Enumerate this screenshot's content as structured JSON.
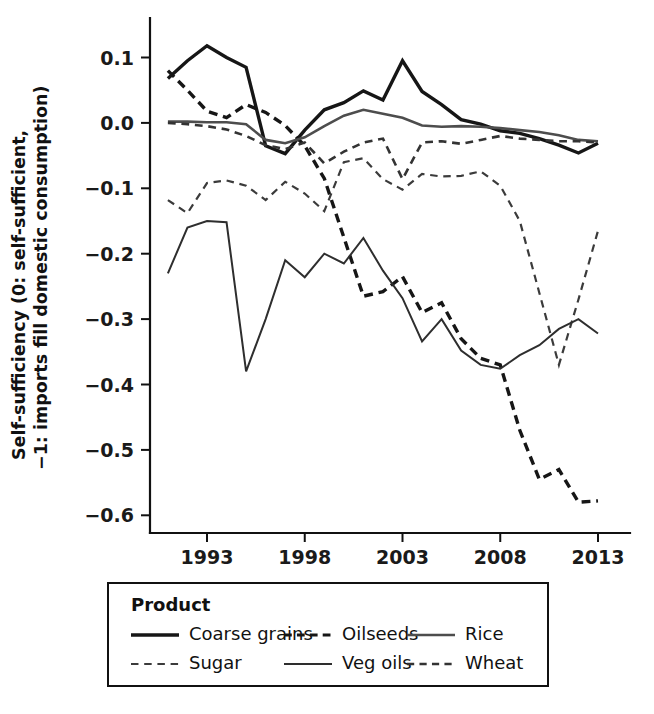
{
  "chart_data": {
    "type": "line",
    "title": "",
    "xlabel": "",
    "ylabel": "Self-sufficiency (0: self-sufficient,\n−1: imports fill domestic consumption)",
    "ylabel_line1": "Self-sufficiency (0: self-sufficient,",
    "ylabel_line2": "−1: imports fill domestic consumption)",
    "grid": false,
    "legend_position": "bottom",
    "legend_title": "Product",
    "xlim": [
      1991,
      2013
    ],
    "ylim": [
      -0.62,
      0.14
    ],
    "x_tick_labels": [
      "1993",
      "1998",
      "2003",
      "2008",
      "2013"
    ],
    "x_ticks": [
      1993,
      1998,
      2003,
      2008,
      2013
    ],
    "y_tick_labels": [
      "0.1",
      "0.0",
      "−0.1",
      "−0.2",
      "−0.3",
      "−0.4",
      "−0.5",
      "−0.6"
    ],
    "y_ticks": [
      0.1,
      0.0,
      -0.1,
      -0.2,
      -0.3,
      -0.4,
      -0.5,
      -0.6
    ],
    "x": [
      1991,
      1992,
      1993,
      1994,
      1995,
      1996,
      1997,
      1998,
      1999,
      2000,
      2001,
      2002,
      2003,
      2004,
      2005,
      2006,
      2007,
      2008,
      2009,
      2010,
      2011,
      2012,
      2013
    ],
    "series": [
      {
        "name": "Coarse grains",
        "style": "solid",
        "width": 3.4,
        "color": "#161616",
        "values": [
          0.068,
          0.095,
          0.118,
          0.1,
          0.085,
          -0.035,
          -0.047,
          -0.011,
          0.02,
          0.031,
          0.049,
          0.035,
          0.095,
          0.048,
          0.028,
          0.005,
          -0.002,
          -0.012,
          -0.016,
          -0.024,
          -0.034,
          -0.046,
          -0.031
        ]
      },
      {
        "name": "Oilseeds",
        "style": "dashed-coarse",
        "width": 3.4,
        "color": "#161616",
        "values": [
          0.08,
          0.05,
          0.018,
          0.008,
          0.028,
          0.016,
          -0.004,
          -0.035,
          -0.085,
          -0.175,
          -0.265,
          -0.258,
          -0.235,
          -0.29,
          -0.275,
          -0.33,
          -0.36,
          -0.37,
          -0.47,
          -0.545,
          -0.53,
          -0.58,
          -0.578
        ]
      },
      {
        "name": "Rice",
        "style": "solid",
        "width": 2.6,
        "color": "#4d4d4d",
        "values": [
          0.002,
          0.002,
          0.001,
          0.001,
          -0.002,
          -0.026,
          -0.031,
          -0.022,
          -0.005,
          0.011,
          0.02,
          0.014,
          0.008,
          -0.004,
          -0.006,
          -0.005,
          -0.006,
          -0.008,
          -0.011,
          -0.014,
          -0.019,
          -0.026,
          -0.028
        ]
      },
      {
        "name": "Sugar",
        "style": "dashed-fine",
        "width": 2.2,
        "color": "#3b3b3b",
        "values": [
          -0.118,
          -0.138,
          -0.092,
          -0.088,
          -0.096,
          -0.118,
          -0.09,
          -0.108,
          -0.135,
          -0.06,
          -0.054,
          -0.086,
          -0.102,
          -0.078,
          -0.082,
          -0.081,
          -0.074,
          -0.096,
          -0.15,
          -0.26,
          -0.37,
          -0.27,
          -0.165
        ]
      },
      {
        "name": "Veg oils",
        "style": "solid",
        "width": 2.0,
        "color": "#2e2e2e",
        "values": [
          -0.23,
          -0.16,
          -0.15,
          -0.152,
          -0.38,
          -0.3,
          -0.21,
          -0.236,
          -0.2,
          -0.215,
          -0.176,
          -0.226,
          -0.268,
          -0.334,
          -0.3,
          -0.348,
          -0.37,
          -0.376,
          -0.355,
          -0.34,
          -0.315,
          -0.3,
          -0.322
        ]
      },
      {
        "name": "Wheat",
        "style": "dashed-medium",
        "width": 2.6,
        "color": "#333333",
        "values": [
          0.0,
          -0.002,
          -0.005,
          -0.01,
          -0.02,
          -0.034,
          -0.04,
          -0.03,
          -0.062,
          -0.044,
          -0.03,
          -0.024,
          -0.086,
          -0.03,
          -0.028,
          -0.032,
          -0.026,
          -0.02,
          -0.024,
          -0.026,
          -0.028,
          -0.028,
          -0.03
        ]
      }
    ],
    "legend_entries": [
      {
        "label": "Coarse grains",
        "style": "solid",
        "width": 3.4,
        "color": "#161616"
      },
      {
        "label": "Oilseeds",
        "style": "dashed-coarse",
        "width": 3.0,
        "color": "#161616"
      },
      {
        "label": "Rice",
        "style": "solid",
        "width": 2.4,
        "color": "#4d4d4d"
      },
      {
        "label": "Sugar",
        "style": "dashed-fine",
        "width": 2.2,
        "color": "#3b3b3b"
      },
      {
        "label": "Veg oils",
        "style": "solid",
        "width": 2.0,
        "color": "#2e2e2e"
      },
      {
        "label": "Wheat",
        "style": "dashed-medium",
        "width": 2.4,
        "color": "#333333"
      }
    ]
  }
}
